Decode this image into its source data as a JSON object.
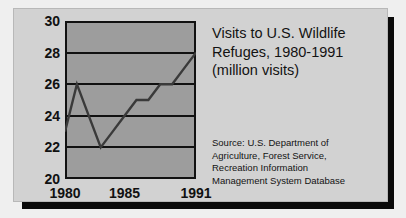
{
  "card": {
    "background_color": "#d2d2d2",
    "shadow_color": "#0a0a0a"
  },
  "title": {
    "line1": "Visits to U.S. Wildlife",
    "line2": "Refuges, 1980-1991",
    "line3": "(million visits)"
  },
  "source": {
    "line1": "Source: U.S. Department of",
    "line2": "Agriculture, Forest Service,",
    "line3": "Recreation Information",
    "line4": "Management System Database"
  },
  "chart_data": {
    "type": "line",
    "title": "Visits to U.S. Wildlife Refuges, 1980-1991 (million visits)",
    "xlabel": "",
    "ylabel": "million visits",
    "x": [
      1980,
      1981,
      1982,
      1983,
      1984,
      1985,
      1986,
      1987,
      1988,
      1989,
      1990,
      1991
    ],
    "values": [
      23,
      26,
      24,
      22,
      23,
      24,
      25,
      25,
      26,
      26,
      27,
      28
    ],
    "series": [
      {
        "name": "Visits to U.S. Wildlife Refuges",
        "values": [
          23,
          26,
          24,
          22,
          23,
          24,
          25,
          25,
          26,
          26,
          27,
          28
        ]
      }
    ],
    "ylim": [
      20,
      30
    ],
    "xlim": [
      1980,
      1991
    ],
    "yticks": [
      20,
      22,
      24,
      26,
      28,
      30
    ],
    "ytick_labels": [
      "20",
      "22",
      "24",
      "26",
      "28",
      "30"
    ],
    "xticks": [
      1980,
      1985,
      1991
    ],
    "xtick_labels": [
      "1980",
      "1985",
      "1991"
    ],
    "grid": true,
    "grid_axis": "y",
    "legend": false,
    "line_color": "#3a3a3a",
    "plot_background_color": "#9d9d9d",
    "axis_color": "#111111"
  }
}
